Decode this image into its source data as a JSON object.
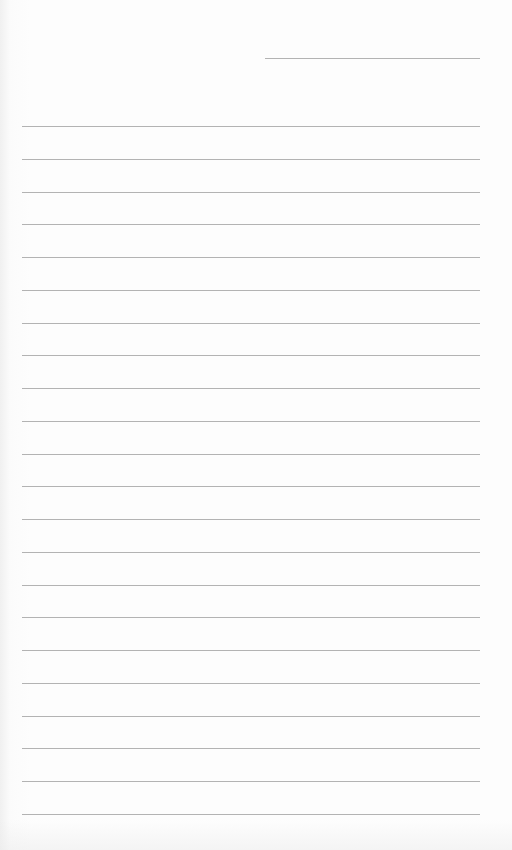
{
  "page": {
    "type": "lined-notebook-page",
    "background_color": "#fdfdfd",
    "rule_color": "#9a9a9a",
    "header_line": {
      "x1": 265,
      "x2": 480,
      "y": 58
    },
    "ruled_lines": {
      "count": 22,
      "x1": 22,
      "x2": 480,
      "first_y": 126,
      "spacing": 32.76
    }
  }
}
